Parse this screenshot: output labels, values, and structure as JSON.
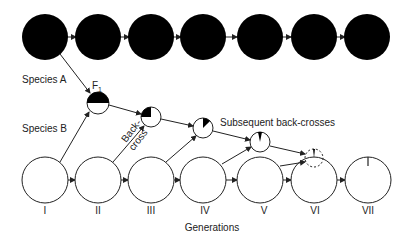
{
  "diagram": {
    "labels": {
      "species_a": "Species A",
      "species_b": "Species B",
      "f1": "F",
      "f1_sub": "1",
      "backcross_line1": "Back-",
      "backcross_line2": "cross",
      "subsequent": "Subsequent back-crosses",
      "axis_title": "Generations"
    },
    "generations": [
      "I",
      "II",
      "III",
      "IV",
      "V",
      "VI",
      "VII"
    ],
    "species_a_row": {
      "count": 7,
      "fill": "#000000"
    },
    "species_b_row": {
      "count": 7,
      "fill": "#ffffff"
    },
    "hybrids": [
      {
        "generation": "II",
        "label": "F1",
        "species_a_fraction": 0.5
      },
      {
        "generation": "III",
        "species_a_fraction": 0.25
      },
      {
        "generation": "IV",
        "species_a_fraction": 0.125
      },
      {
        "generation": "V",
        "species_a_fraction": 0.0625
      },
      {
        "generation": "VI",
        "species_a_fraction": 0.03125,
        "dashed": true
      },
      {
        "generation": "VII",
        "species_a_fraction": 0.0
      }
    ]
  }
}
